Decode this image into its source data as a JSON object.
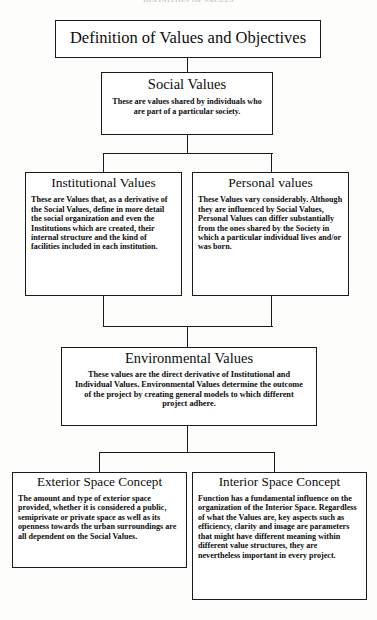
{
  "page": {
    "running_head": "DEFINITION OF VALUES",
    "width": 377,
    "height": 620,
    "background_color": "#fdfdfb",
    "line_color": "#1a1a1a",
    "box_fill": "#ffffff"
  },
  "diagram": {
    "type": "flowchart",
    "orientation": "top-down",
    "nodes": {
      "root": {
        "title": "Definition of Values and Objectives",
        "body": ""
      },
      "social": {
        "title": "Social Values",
        "body": "These are values shared by individuals who are part of a particular society."
      },
      "institutional": {
        "title": "Institutional Values",
        "body": "These are Values that, as a derivative of the Social Values, define in more detail the social organization and even the Institutions which are created, their internal structure and the kind of facilities included in each institution."
      },
      "personal": {
        "title": "Personal values",
        "body": "These Values vary considerably. Although they are influenced by Social Values, Personal Values can differ substantially from the ones shared by the Society in which a particular individual lives and/or was born."
      },
      "environmental": {
        "title": "Environmental Values",
        "body": "These values are the direct derivative of Institutional and Individual Values. Environmental Values determine the outcome of the project by creating general models to which different project adhere."
      },
      "exterior": {
        "title": "Exterior Space Concept",
        "body": "The amount and type of exterior space provided, whether it is considered a public, semiprivate or private space as well as its openness towards the urban surroundings are all dependent on the Social Values."
      },
      "interior": {
        "title": "Interior Space Concept",
        "body": "Function has a fundamental influence on the organization of the Interior Space. Regardless of what the Values are, key aspects such as efficiency, clarity and image are parameters that might have different meaning within different value structures, they are nevertheless important in every project."
      }
    },
    "edges": [
      {
        "from": "root",
        "to": "social"
      },
      {
        "from": "social",
        "to": "institutional"
      },
      {
        "from": "social",
        "to": "personal"
      },
      {
        "from": "institutional",
        "to": "environmental"
      },
      {
        "from": "personal",
        "to": "environmental"
      },
      {
        "from": "environmental",
        "to": "exterior"
      },
      {
        "from": "environmental",
        "to": "interior"
      }
    ]
  }
}
